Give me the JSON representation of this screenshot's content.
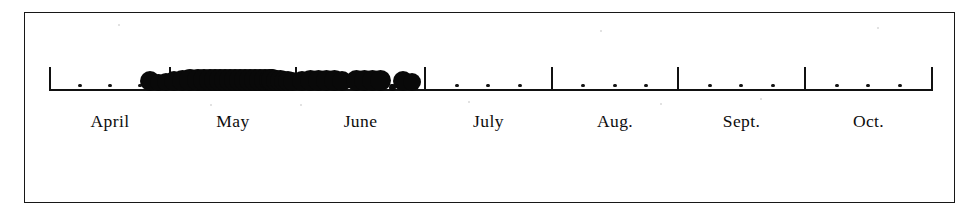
{
  "figure": {
    "background_color": "#ffffff",
    "ink_color": "#0d0d0d",
    "frame": {
      "x": 24,
      "y": 12,
      "width": 931,
      "height": 191
    }
  },
  "chart_data": {
    "type": "scatter",
    "subtype": "one-dimensional dot plot / strip chart on a time axis",
    "title": "",
    "subtitle": "",
    "xlabel": "",
    "ylabel": "",
    "grid": false,
    "legend": null,
    "legend_position": "none",
    "axis": {
      "orientation": "horizontal",
      "baseline_y_px": 89,
      "x_start_px": 50,
      "x_end_px": 932,
      "tick_direction": "up",
      "major_tick_height_px": 22,
      "minor_tick_style": "dot",
      "categories": [
        "April",
        "May",
        "June",
        "July",
        "Aug.",
        "Sept.",
        "Oct."
      ],
      "tick_labels": [
        "April",
        "May",
        "June",
        "July",
        "Aug.",
        "Sept.",
        "Oct."
      ],
      "major_tick_positions_px": [
        50,
        170,
        296,
        425,
        552,
        678,
        805,
        932
      ],
      "month_span_px": 126,
      "minor_ticks_per_month": 3,
      "minor_tick_meaning": "weekly subdivisions (approx. 1/4, 1/2, 3/4 of each month)"
    },
    "months": [
      {
        "label": "April",
        "start_px": 50,
        "end_px": 170,
        "center_px": 110,
        "minor_ticks_px": [
          80,
          110,
          140
        ]
      },
      {
        "label": "May",
        "start_px": 170,
        "end_px": 296,
        "center_px": 233,
        "minor_ticks_px": [
          201,
          233,
          264
        ]
      },
      {
        "label": "June",
        "start_px": 296,
        "end_px": 425,
        "center_px": 360,
        "minor_ticks_px": [
          328,
          360,
          392
        ]
      },
      {
        "label": "July",
        "start_px": 425,
        "end_px": 552,
        "center_px": 488,
        "minor_ticks_px": [
          457,
          488,
          520
        ]
      },
      {
        "label": "Aug.",
        "start_px": 552,
        "end_px": 678,
        "center_px": 615,
        "minor_ticks_px": [
          583,
          615,
          646
        ]
      },
      {
        "label": "Sept.",
        "start_px": 678,
        "end_px": 805,
        "center_px": 741,
        "minor_ticks_px": [
          710,
          741,
          773
        ]
      },
      {
        "label": "Oct.",
        "start_px": 805,
        "end_px": 932,
        "center_px": 868,
        "minor_ticks_px": [
          837,
          868,
          900
        ]
      }
    ],
    "x": [
      150,
      158,
      166,
      174,
      182,
      190,
      198,
      204,
      210,
      215,
      220,
      225,
      230,
      235,
      240,
      245,
      250,
      255,
      260,
      265,
      270,
      272,
      276,
      280,
      284,
      288,
      292,
      302,
      310,
      318,
      326,
      334,
      342,
      356,
      364,
      372,
      380,
      392,
      403,
      412
    ],
    "y": [
      0,
      0,
      0,
      0,
      0,
      0,
      0,
      0,
      0,
      0,
      0,
      0,
      0,
      0,
      0,
      0,
      0,
      0,
      0,
      0,
      0,
      0,
      0,
      0,
      0,
      0,
      0,
      0,
      0,
      0,
      0,
      0,
      0,
      0,
      0,
      0,
      0,
      0,
      0,
      0
    ],
    "point_sizes_px": [
      20,
      17,
      18,
      20,
      21,
      22,
      22,
      22,
      22,
      22,
      22,
      22,
      22,
      22,
      22,
      22,
      22,
      22,
      22,
      22,
      22,
      22,
      21,
      21,
      20,
      20,
      19,
      20,
      21,
      21,
      21,
      21,
      20,
      21,
      21,
      21,
      21,
      7,
      20,
      18
    ],
    "values_note": "Each filled dot marks one observation date; dots overlap heavily where records are dense.",
    "n_points": 40,
    "occurrence_range": {
      "first": "late April",
      "last": "late June"
    },
    "density_by_month": [
      {
        "month": "April",
        "count": 1,
        "description": "a single record at the very end of April"
      },
      {
        "month": "May",
        "count": 26,
        "description": "continuous solid band spanning the whole month — peak occurrence"
      },
      {
        "month": "June",
        "count": 13,
        "description": "dense band in the first half, then scattered pairs and singles"
      },
      {
        "month": "July",
        "count": 0,
        "description": "no records"
      },
      {
        "month": "Aug.",
        "count": 0,
        "description": "no records"
      },
      {
        "month": "Sept.",
        "count": 0,
        "description": "no records"
      },
      {
        "month": "Oct.",
        "count": 0,
        "description": "no records"
      }
    ],
    "xlim_labels": [
      "April",
      "Oct."
    ]
  },
  "annotations": []
}
